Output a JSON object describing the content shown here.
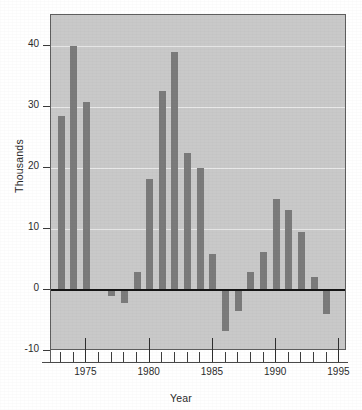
{
  "chart_data": {
    "type": "bar",
    "title": "",
    "xlabel": "Year",
    "ylabel": "Thousands",
    "categories": [
      1973,
      1974,
      1975,
      1976,
      1977,
      1978,
      1979,
      1980,
      1981,
      1982,
      1983,
      1984,
      1985,
      1986,
      1987,
      1988,
      1989,
      1990,
      1991,
      1992,
      1993,
      1994
    ],
    "values": [
      28.4,
      40.0,
      30.8,
      0,
      -1.0,
      -2.1,
      3.0,
      18.1,
      32.5,
      38.9,
      22.4,
      20.0,
      5.9,
      -6.8,
      -3.5,
      2.9,
      6.2,
      14.8,
      13.0,
      9.4,
      2.1,
      -4.0
    ],
    "ylim": [
      -10,
      45
    ],
    "xlim": [
      1972.2,
      1995.6
    ],
    "yticks": [
      -10,
      0,
      10,
      20,
      30,
      40
    ],
    "ytick_labels": [
      "-10",
      "0",
      "10",
      "20",
      "30",
      "40"
    ],
    "xticks_major": [
      1975,
      1980,
      1985,
      1990,
      1995
    ],
    "xtick_major_labels": [
      "1975",
      "1980",
      "1985",
      "1990",
      "1995"
    ],
    "xticks_minor": [
      1973,
      1974,
      1976,
      1977,
      1978,
      1979,
      1981,
      1982,
      1983,
      1984,
      1986,
      1987,
      1988,
      1989,
      1991,
      1992,
      1993,
      1994
    ],
    "grid": true,
    "gridlines_at": [
      10,
      20,
      30,
      40
    ],
    "legend": null,
    "zero_line": 0,
    "colors": {
      "bar": "#7b7b7b",
      "panel_background": "#c9c9c9",
      "gridline": "#e9e9e9",
      "zero_line": "#151515",
      "axis": "#5e5e5e",
      "text": "#2b2b2b",
      "page_background": "#ffffff"
    }
  }
}
